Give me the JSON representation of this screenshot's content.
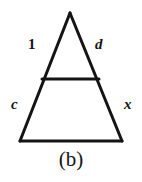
{
  "figure": {
    "caption": "(b)",
    "background_color": "#ffffff",
    "stroke_color": "#141414",
    "labels": {
      "upper_left": "1",
      "upper_right": "d",
      "lower_left": "c",
      "lower_right": "x"
    },
    "geometry": {
      "apex": [
        70,
        13
      ],
      "base_left": [
        20,
        141
      ],
      "base_right": [
        122,
        141
      ],
      "crossbar_left": [
        42,
        79
      ],
      "crossbar_right": [
        99,
        79
      ],
      "stroke_width": 3
    }
  }
}
